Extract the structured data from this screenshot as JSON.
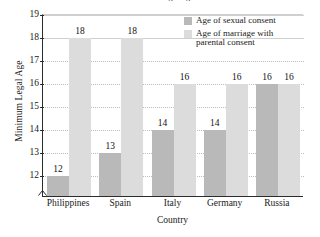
{
  "chart_data": {
    "type": "bar",
    "title": "Minimum Legal Ages",
    "xlabel": "Country",
    "ylabel": "Minimum Legal Age",
    "categories": [
      "Philippines",
      "Spain",
      "Italy",
      "Germany",
      "Russia"
    ],
    "series": [
      {
        "name": "Age of sexual consent",
        "color": "#b9b9b9",
        "values": [
          12,
          13,
          14,
          14,
          16
        ]
      },
      {
        "name": "Age of marriage with parental consent",
        "color": "#dcdcdc",
        "values": [
          18,
          18,
          16,
          16,
          16
        ]
      }
    ],
    "ylim": [
      12,
      19
    ],
    "yticks": [
      12,
      13,
      14,
      15,
      16,
      17,
      18,
      19
    ],
    "ytick_labels": [
      "12",
      "13",
      "14",
      "15",
      "16",
      "17",
      "18",
      "19"
    ],
    "grid": true,
    "axis_break": true,
    "legend_position": "top-right",
    "legend": [
      "Age of sexual consent",
      "Age of marriage with parental consent"
    ],
    "legend_lines": [
      [
        "Age of sexual consent"
      ],
      [
        "Age of marriage with",
        "parental consent"
      ]
    ],
    "bar_labels": [
      "12",
      "18",
      "13",
      "18",
      "14",
      "16",
      "14",
      "16",
      "16",
      "16"
    ]
  }
}
